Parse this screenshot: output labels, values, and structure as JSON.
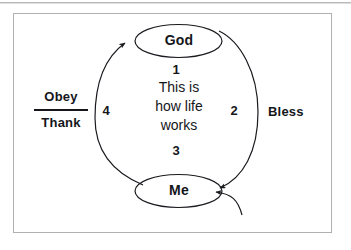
{
  "page": {
    "background_color": "#ffffff",
    "border_color": "#b0b0b0",
    "ink_color": "#15161a"
  },
  "diagram": {
    "type": "cycle-diagram",
    "nodes": [
      {
        "id": "god",
        "label": "God",
        "shape": "ellipse",
        "position": "top"
      },
      {
        "id": "me",
        "label": "Me",
        "shape": "ellipse",
        "position": "bottom"
      }
    ],
    "center_text": {
      "line1": "This is",
      "line2": "how life",
      "line3": "works"
    },
    "steps": [
      {
        "number": "1",
        "position": "top-center"
      },
      {
        "number": "2",
        "position": "right"
      },
      {
        "number": "3",
        "position": "bottom-center"
      },
      {
        "number": "4",
        "position": "left"
      }
    ],
    "side_labels": {
      "left_numerator": "Obey",
      "left_denominator": "Thank",
      "right": "Bless"
    },
    "arrows": [
      {
        "id": "left-arc",
        "from": "me",
        "to": "god",
        "direction": "counter-clockwise",
        "arrowhead": "at-god"
      },
      {
        "id": "right-arc",
        "from": "god",
        "to": "me",
        "direction": "clockwise",
        "arrowhead": "at-me"
      },
      {
        "id": "extra-arc",
        "from": "bottom-right",
        "to": "me",
        "arrowhead": "at-me"
      }
    ]
  }
}
